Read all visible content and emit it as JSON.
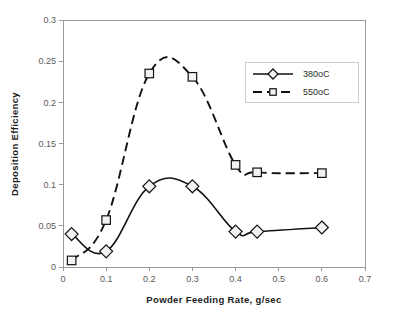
{
  "chart_data": {
    "type": "line",
    "title": "",
    "xlabel": "Powder Feeding Rate, g/sec",
    "ylabel": "Deposition Efficiency",
    "xlim": [
      0,
      0.7
    ],
    "ylim": [
      0,
      0.3
    ],
    "xticks": [
      "0",
      "0.1",
      "0.2",
      "0.3",
      "0.4",
      "0.5",
      "0.6",
      "0.7"
    ],
    "xtick_values": [
      0,
      0.1,
      0.2,
      0.3,
      0.4,
      0.5,
      0.6,
      0.7
    ],
    "yticks": [
      "0",
      "0.05",
      "0.1",
      "0.15",
      "0.2",
      "0.25",
      "0.3"
    ],
    "ytick_values": [
      0,
      0.05,
      0.1,
      0.15,
      0.2,
      0.25,
      0.3
    ],
    "grid": false,
    "legend_position": "top-right",
    "series": [
      {
        "name": "380oC",
        "marker": "diamond",
        "linestyle": "solid",
        "color": "#111111",
        "x": [
          0.02,
          0.1,
          0.2,
          0.3,
          0.4,
          0.45,
          0.6
        ],
        "values": [
          0.04,
          0.019,
          0.098,
          0.098,
          0.043,
          0.043,
          0.048
        ]
      },
      {
        "name": "550oC",
        "marker": "square",
        "linestyle": "dashed",
        "color": "#111111",
        "x": [
          0.02,
          0.1,
          0.2,
          0.3,
          0.4,
          0.45,
          0.6
        ],
        "values": [
          0.008,
          0.057,
          0.235,
          0.231,
          0.124,
          0.115,
          0.114
        ]
      }
    ]
  },
  "legend": {
    "entries": [
      {
        "label": "380oC"
      },
      {
        "label": "550oC"
      }
    ]
  }
}
